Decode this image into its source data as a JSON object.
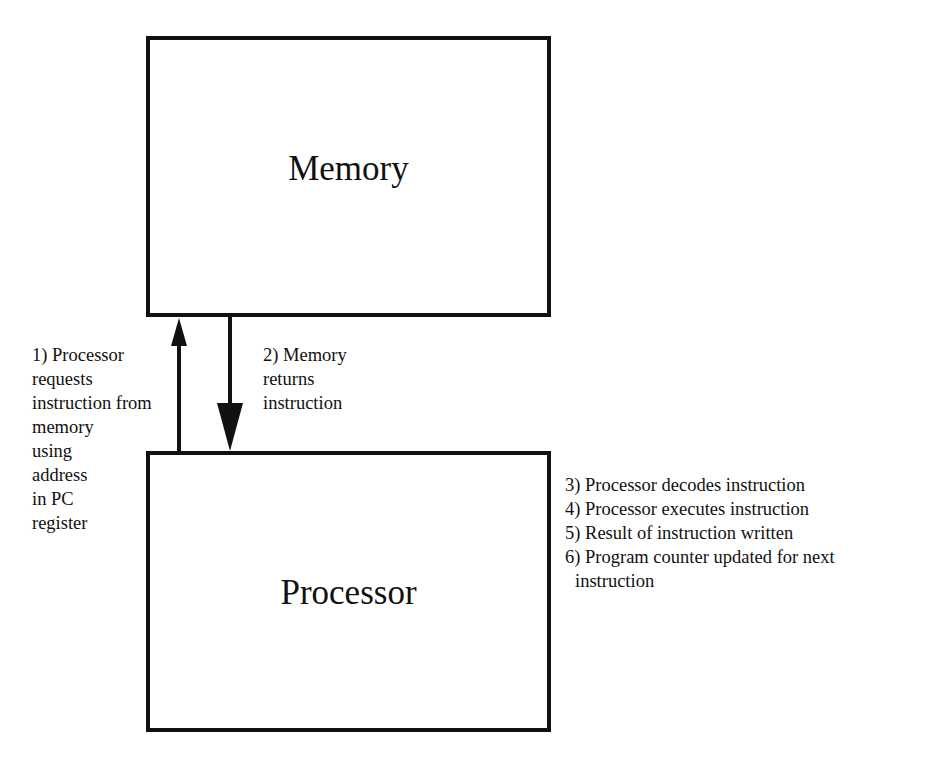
{
  "diagram": {
    "memory": {
      "title": "Memory"
    },
    "processor": {
      "title": "Processor"
    },
    "arrow_request": {
      "direction": "up",
      "from": "Processor",
      "to": "Memory",
      "label_lines": [
        "1) Processor",
        "requests",
        "instruction from",
        "memory",
        "using",
        "address",
        "in PC",
        "register"
      ]
    },
    "arrow_return": {
      "direction": "down",
      "from": "Memory",
      "to": "Processor",
      "label_lines": [
        "2) Memory",
        "returns",
        "instruction"
      ]
    },
    "steps": [
      {
        "text": "3) Processor decodes instruction"
      },
      {
        "text": "4) Processor executes instruction"
      },
      {
        "text": "5) Result of instruction written"
      },
      {
        "text": "6) Program counter updated for next",
        "continuation": "instruction"
      }
    ],
    "colors": {
      "stroke": "#111111",
      "background": "#ffffff",
      "text": "#111111"
    }
  }
}
